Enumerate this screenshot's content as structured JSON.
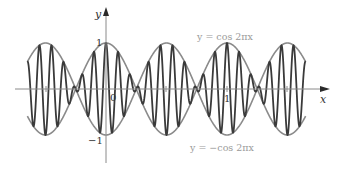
{
  "chart_data": {
    "type": "line",
    "title": "",
    "xlabel": "x",
    "ylabel": "y",
    "xlim": [
      -0.65,
      1.65
    ],
    "ylim": [
      -1,
      1
    ],
    "grid": false,
    "y_ticks": [
      {
        "value": 1,
        "label": "1"
      },
      {
        "value": -1,
        "label": "−1"
      }
    ],
    "x_ticks": [
      {
        "value": -0.5,
        "label": ""
      },
      {
        "value": 0,
        "label": "0"
      },
      {
        "value": 0.5,
        "label": ""
      },
      {
        "value": 1,
        "label": "1"
      },
      {
        "value": 1.5,
        "label": ""
      }
    ],
    "series": [
      {
        "name": "y = cos 2πx",
        "expr": "cos(2*pi*x)",
        "color": "#8a8a8a",
        "width": 1.6
      },
      {
        "name": "y = −cos 2πx",
        "expr": "-cos(2*pi*x)",
        "color": "#8a8a8a",
        "width": 1.6
      },
      {
        "name": "oscillation",
        "expr": "cos(2*pi*x)*cos(20*pi*x)",
        "color": "#3a3a3a",
        "width": 1.8
      }
    ],
    "annotations": [
      {
        "text": "y = cos 2πx",
        "x_px": 199,
        "y_px": 40
      },
      {
        "text": "y = −cos 2πx",
        "x_px": 190,
        "y_px": 151
      }
    ]
  },
  "axes": {
    "x_label": "x",
    "y_label": "y",
    "origin_label": "0",
    "tick_one_x": "1",
    "tick_one_y": "1",
    "tick_neg_one_y": "−1"
  },
  "labels": {
    "upper": "y = cos 2πx",
    "lower": "y = −cos 2πx"
  }
}
